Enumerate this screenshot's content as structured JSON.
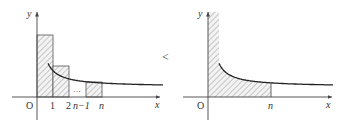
{
  "figure": {
    "left_panel": {
      "axis_labels": {
        "x": "x",
        "y": "y",
        "origin": "O"
      },
      "tick_labels": [
        "1",
        "2",
        "n−1",
        "n"
      ],
      "ellipsis": "…",
      "rectangles": [
        {
          "from": 0,
          "to": 1,
          "label": "rect-0-1"
        },
        {
          "from": 1,
          "to": 2,
          "label": "rect-1-2"
        },
        {
          "from": "n-1",
          "to": "n",
          "label": "rect-n-1-n"
        }
      ]
    },
    "comparison_symbol": "<",
    "right_panel": {
      "axis_labels": {
        "x": "x",
        "y": "y",
        "origin": "O"
      },
      "tick_labels": [
        "n"
      ],
      "shaded_region": "area under curve from 0 to n"
    },
    "colors": {
      "curve": "#222222",
      "axis": "#444444",
      "hatch": "#9a9a9a",
      "fill": "#f2f2f2"
    }
  }
}
